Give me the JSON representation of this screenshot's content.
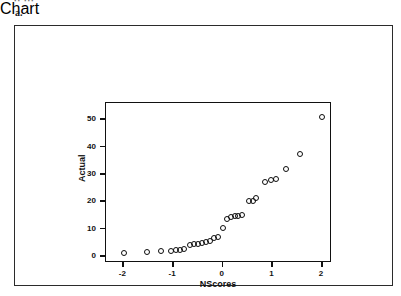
{
  "figure": {
    "top_fragment": "·· ···",
    "label": "a."
  },
  "chart_data": {
    "type": "scatter",
    "title": "",
    "subtitle": "",
    "xlabel": "NScores",
    "ylabel": "Actual",
    "xlim": [
      -2.35,
      2.2
    ],
    "ylim": [
      -2.5,
      56
    ],
    "xticks": [
      -2,
      -1,
      0,
      1,
      2
    ],
    "xticklabels": [
      "-2",
      "-1",
      "0",
      "1",
      "2"
    ],
    "yticks": [
      0,
      10,
      20,
      30,
      40,
      50
    ],
    "yticklabels": [
      "0",
      "10",
      "20",
      "30",
      "40",
      "50"
    ],
    "grid": false,
    "legend": null,
    "marker": "open-circle",
    "marker_color": "#0c0c0c",
    "points": [
      {
        "x": -1.98,
        "y": 1.1
      },
      {
        "x": -1.52,
        "y": 1.4
      },
      {
        "x": -1.24,
        "y": 1.8
      },
      {
        "x": -1.05,
        "y": 1.8
      },
      {
        "x": -0.95,
        "y": 2.1
      },
      {
        "x": -0.86,
        "y": 2.4
      },
      {
        "x": -0.78,
        "y": 2.8
      },
      {
        "x": -0.66,
        "y": 4.2
      },
      {
        "x": -0.58,
        "y": 4.6
      },
      {
        "x": -0.5,
        "y": 4.6
      },
      {
        "x": -0.42,
        "y": 4.9
      },
      {
        "x": -0.34,
        "y": 5.3
      },
      {
        "x": -0.26,
        "y": 5.7
      },
      {
        "x": -0.18,
        "y": 6.7
      },
      {
        "x": -0.1,
        "y": 7.0
      },
      {
        "x": 0.0,
        "y": 10.2
      },
      {
        "x": 0.09,
        "y": 13.5
      },
      {
        "x": 0.17,
        "y": 14.3
      },
      {
        "x": 0.25,
        "y": 14.6
      },
      {
        "x": 0.31,
        "y": 14.8
      },
      {
        "x": 0.38,
        "y": 14.9
      },
      {
        "x": 0.53,
        "y": 20.0
      },
      {
        "x": 0.6,
        "y": 20.3
      },
      {
        "x": 0.67,
        "y": 21.3
      },
      {
        "x": 0.85,
        "y": 27.0
      },
      {
        "x": 0.97,
        "y": 28.0
      },
      {
        "x": 1.08,
        "y": 28.1
      },
      {
        "x": 1.28,
        "y": 32.0
      },
      {
        "x": 1.56,
        "y": 37.4
      },
      {
        "x": 2.0,
        "y": 51.0
      }
    ]
  }
}
